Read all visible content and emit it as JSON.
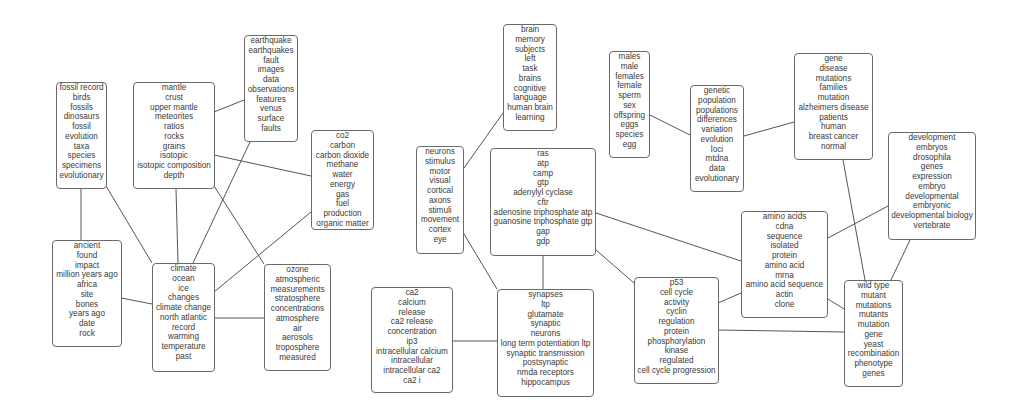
{
  "diagram": {
    "type": "topic-network",
    "colors": {
      "border": "#6a6a6a",
      "edge": "#555555",
      "text": "#3a3a3a",
      "background": "#ffffff"
    },
    "nodes": [
      {
        "id": "paleontology",
        "x": 56,
        "y": 82,
        "w": 51,
        "h": 107,
        "terms": [
          "fossil record",
          "birds",
          "fossils",
          "dinosaurs",
          "fossil",
          "evolution",
          "taxa",
          "species",
          "specimens",
          "evolutionary"
        ]
      },
      {
        "id": "geochemistry",
        "x": 133,
        "y": 82,
        "w": 82,
        "h": 107,
        "terms": [
          "mantle",
          "crust",
          "upper mantle",
          "meteorites",
          "ratios",
          "rocks",
          "grains",
          "isotopic",
          "isotopic composition",
          "depth"
        ]
      },
      {
        "id": "seismology",
        "x": 244,
        "y": 35,
        "w": 54,
        "h": 107,
        "terms": [
          "earthquake",
          "earthquakes",
          "fault",
          "images",
          "data",
          "observations",
          "features",
          "venus",
          "surface",
          "faults"
        ]
      },
      {
        "id": "carbon-cycle",
        "x": 311,
        "y": 130,
        "w": 63,
        "h": 100,
        "terms": [
          "co2",
          "carbon",
          "carbon dioxide",
          "methane",
          "water",
          "energy",
          "gas",
          "fuel",
          "production",
          "organic matter"
        ]
      },
      {
        "id": "archaeology",
        "x": 52,
        "y": 240,
        "w": 70,
        "h": 107,
        "terms": [
          "ancient",
          "found",
          "impact",
          "million years ago",
          "africa",
          "site",
          "bones",
          "years ago",
          "date",
          "rock"
        ]
      },
      {
        "id": "climate",
        "x": 152,
        "y": 263,
        "w": 63,
        "h": 109,
        "terms": [
          "climate",
          "ocean",
          "ice",
          "changes",
          "climate change",
          "north atlantic",
          "record",
          "warming",
          "temperature",
          "past"
        ]
      },
      {
        "id": "atmosphere",
        "x": 264,
        "y": 264,
        "w": 67,
        "h": 107,
        "terms": [
          "ozone",
          "atmospheric",
          "measurements",
          "stratosphere",
          "concentrations",
          "atmosphere",
          "air",
          "aerosols",
          "troposphere",
          "measured"
        ]
      },
      {
        "id": "neuroscience-sensory",
        "x": 416,
        "y": 146,
        "w": 48,
        "h": 108,
        "terms": [
          "neurons",
          "stimulus",
          "motor",
          "visual",
          "cortical",
          "axons",
          "stimuli",
          "movement",
          "cortex",
          "eye"
        ]
      },
      {
        "id": "cognition",
        "x": 503,
        "y": 24,
        "w": 54,
        "h": 107,
        "terms": [
          "brain",
          "memory",
          "subjects",
          "left",
          "task",
          "brains",
          "cognitive",
          "language",
          "human brain",
          "learning"
        ]
      },
      {
        "id": "signaling",
        "x": 490,
        "y": 148,
        "w": 106,
        "h": 108,
        "terms": [
          "ras",
          "atp",
          "camp",
          "gtp",
          "adenylyl cyclase",
          "cftr",
          "adenosine triphosphate atp",
          "guanosine triphosphate gtp",
          "gap",
          "gdp"
        ]
      },
      {
        "id": "calcium",
        "x": 371,
        "y": 287,
        "w": 82,
        "h": 106,
        "terms": [
          "ca2",
          "calcium",
          "release",
          "ca2 release",
          "concentration",
          "ip3",
          "intracellular calcium",
          "intracellular",
          "intracellular ca2",
          "ca2 i"
        ]
      },
      {
        "id": "synaptic",
        "x": 497,
        "y": 289,
        "w": 97,
        "h": 108,
        "terms": [
          "synapses",
          "ltp",
          "glutamate",
          "synaptic",
          "neurons",
          "long term potentiation ltp",
          "synaptic transmission",
          "postsynaptic",
          "nmda receptors",
          "hippocampus"
        ]
      },
      {
        "id": "sex",
        "x": 609,
        "y": 51,
        "w": 41,
        "h": 107,
        "terms": [
          "males",
          "male",
          "females",
          "female",
          "sperm",
          "sex",
          "offspring",
          "eggs",
          "species",
          "egg"
        ]
      },
      {
        "id": "population-genetics",
        "x": 690,
        "y": 85,
        "w": 54,
        "h": 107,
        "terms": [
          "genetic",
          "population",
          "populations",
          "differences",
          "variation",
          "evolution",
          "loci",
          "mtdna",
          "data",
          "evolutionary"
        ]
      },
      {
        "id": "disease-genetics",
        "x": 794,
        "y": 53,
        "w": 79,
        "h": 107,
        "terms": [
          "gene",
          "disease",
          "mutations",
          "families",
          "mutation",
          "alzheimers disease",
          "patients",
          "human",
          "breast cancer",
          "normal"
        ]
      },
      {
        "id": "development",
        "x": 888,
        "y": 132,
        "w": 88,
        "h": 108,
        "terms": [
          "development",
          "embryos",
          "drosophila",
          "genes",
          "expression",
          "embryo",
          "developmental",
          "embryonic",
          "developmental biology",
          "vertebrate"
        ]
      },
      {
        "id": "molecular",
        "x": 741,
        "y": 211,
        "w": 87,
        "h": 107,
        "terms": [
          "amino acids",
          "cdna",
          "sequence",
          "isolated",
          "protein",
          "amino acid",
          "mrna",
          "amino acid sequence",
          "actin",
          "clone"
        ]
      },
      {
        "id": "cell-cycle",
        "x": 634,
        "y": 277,
        "w": 85,
        "h": 107,
        "terms": [
          "p53",
          "cell cycle",
          "activity",
          "cyclin",
          "regulation",
          "protein",
          "phosphorylation",
          "kinase",
          "regulated",
          "cell cycle progression"
        ]
      },
      {
        "id": "mutants",
        "x": 844,
        "y": 280,
        "w": 59,
        "h": 107,
        "terms": [
          "wild type",
          "mutant",
          "mutations",
          "mutants",
          "mutation",
          "gene",
          "yeast",
          "recombination",
          "phenotype",
          "genes"
        ]
      }
    ],
    "edges": [
      [
        81,
        189,
        81,
        240
      ],
      [
        106,
        186,
        152,
        263
      ],
      [
        176,
        189,
        178,
        263
      ],
      [
        214,
        186,
        264,
        264
      ],
      [
        214,
        112,
        244,
        100
      ],
      [
        214,
        155,
        311,
        176
      ],
      [
        250,
        142,
        193,
        263
      ],
      [
        311,
        212,
        214,
        292
      ],
      [
        121,
        298,
        152,
        304
      ],
      [
        214,
        318,
        264,
        318
      ],
      [
        464,
        168,
        503,
        113
      ],
      [
        464,
        234,
        497,
        289
      ],
      [
        543,
        256,
        543,
        289
      ],
      [
        453,
        341,
        497,
        341
      ],
      [
        596,
        213,
        741,
        261
      ],
      [
        596,
        250,
        634,
        283
      ],
      [
        650,
        115,
        690,
        135
      ],
      [
        744,
        136,
        794,
        122
      ],
      [
        718,
        303,
        741,
        293
      ],
      [
        828,
        238,
        888,
        206
      ],
      [
        843,
        160,
        865,
        280
      ],
      [
        910,
        240,
        891,
        280
      ],
      [
        719,
        330,
        844,
        332
      ],
      [
        828,
        299,
        844,
        309
      ]
    ]
  }
}
